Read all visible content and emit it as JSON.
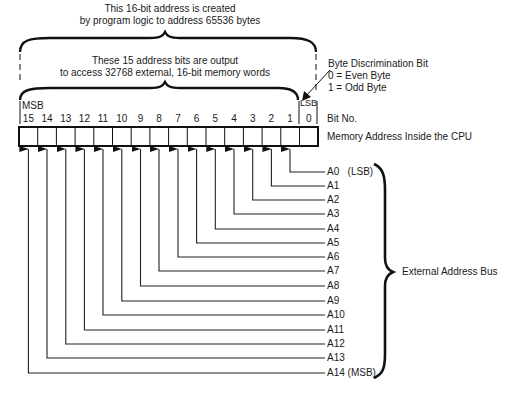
{
  "diagram": {
    "top_caption": {
      "line1": "This 16-bit address is created",
      "line2": "by program logic to address 65536 bytes"
    },
    "inner_caption": {
      "line1": "These 15 address bits are output",
      "line2": "to access 32768 external, 16-bit memory words"
    },
    "byte_discrimination": {
      "title": "Byte Discrimination Bit",
      "line0": "0 = Even Byte",
      "line1": "1 = Odd Byte"
    },
    "msb_label": "MSB",
    "lsb_label": "LSB",
    "bit_numbers": [
      "15",
      "14",
      "13",
      "12",
      "11",
      "10",
      "9",
      "8",
      "7",
      "6",
      "5",
      "4",
      "3",
      "2",
      "1",
      "0"
    ],
    "bit_no_label": "Bit No.",
    "register_label": "Memory Address Inside the CPU",
    "address_lines": [
      {
        "label": "A0",
        "note": "(LSB)",
        "bit": 1
      },
      {
        "label": "A1",
        "note": "",
        "bit": 2
      },
      {
        "label": "A2",
        "note": "",
        "bit": 3
      },
      {
        "label": "A3",
        "note": "",
        "bit": 4
      },
      {
        "label": "A4",
        "note": "",
        "bit": 5
      },
      {
        "label": "A5",
        "note": "",
        "bit": 6
      },
      {
        "label": "A6",
        "note": "",
        "bit": 7
      },
      {
        "label": "A7",
        "note": "",
        "bit": 8
      },
      {
        "label": "A8",
        "note": "",
        "bit": 9
      },
      {
        "label": "A9",
        "note": "",
        "bit": 10
      },
      {
        "label": "A10",
        "note": "",
        "bit": 11
      },
      {
        "label": "A11",
        "note": "",
        "bit": 12
      },
      {
        "label": "A12",
        "note": "",
        "bit": 13
      },
      {
        "label": "A13",
        "note": "",
        "bit": 14
      },
      {
        "label": "A14",
        "note": "(MSB)",
        "bit": 15
      }
    ],
    "bus_label": "External Address Bus"
  }
}
